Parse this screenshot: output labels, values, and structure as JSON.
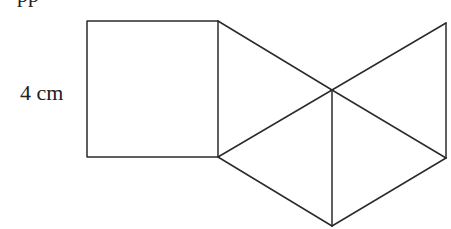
{
  "figure": {
    "type": "net of a square-based pyramid",
    "cut_off_top_text": "pp",
    "dimension_label": "4 cm",
    "stroke_color": "#2b2b2b",
    "square": {
      "x1": 87,
      "y1": 21,
      "x2": 218,
      "y2": 157
    },
    "points": {
      "square_top_right": [
        218,
        21
      ],
      "square_bottom_right": [
        218,
        157
      ],
      "center": [
        332,
        90
      ],
      "top_right": [
        446,
        23
      ],
      "right_bottom": [
        446,
        158
      ],
      "bottom": [
        332,
        226
      ]
    }
  }
}
